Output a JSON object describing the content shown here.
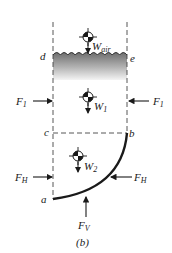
{
  "figure": {
    "caption": "(b)",
    "colors": {
      "ink": "#1a1a1a",
      "water_top": "#7a7a7a",
      "water_bottom": "#f2f2f2",
      "dashed": "#444444"
    },
    "points": {
      "a": "a",
      "b": "b",
      "c": "c",
      "d": "d",
      "e": "e"
    },
    "weights": {
      "air": {
        "symbol": "W",
        "sub": "air"
      },
      "w1": {
        "symbol": "W",
        "sub": "1"
      },
      "w2": {
        "symbol": "W",
        "sub": "2"
      }
    },
    "forces": {
      "f1_left": {
        "symbol": "F",
        "sub": "1"
      },
      "f1_right": {
        "symbol": "F",
        "sub": "1"
      },
      "fh_left": {
        "symbol": "F",
        "sub": "H"
      },
      "fh_right": {
        "symbol": "F",
        "sub": "H"
      },
      "fv": {
        "symbol": "F",
        "sub": "V"
      }
    }
  }
}
